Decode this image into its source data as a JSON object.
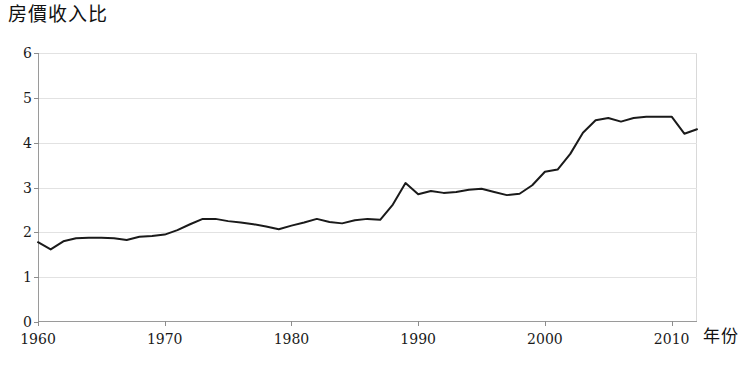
{
  "chart_data": {
    "type": "line",
    "title": "房價收入比",
    "xlabel": "年份",
    "ylabel": "",
    "xlim": [
      1960,
      2012
    ],
    "ylim": [
      0,
      6
    ],
    "grid": true,
    "legend": "none",
    "y_ticks": [
      0,
      1,
      2,
      3,
      4,
      5,
      6
    ],
    "x_ticks": [
      1960,
      1970,
      1980,
      1990,
      2000,
      2010
    ],
    "x": [
      1960,
      1961,
      1962,
      1963,
      1964,
      1965,
      1966,
      1967,
      1968,
      1969,
      1970,
      1971,
      1972,
      1973,
      1974,
      1975,
      1976,
      1977,
      1978,
      1979,
      1980,
      1981,
      1982,
      1983,
      1984,
      1985,
      1986,
      1987,
      1988,
      1989,
      1990,
      1991,
      1992,
      1993,
      1994,
      1995,
      1996,
      1997,
      1998,
      1999,
      2000,
      2001,
      2002,
      2003,
      2004,
      2005,
      2006,
      2007,
      2008,
      2009,
      2010,
      2011,
      2012
    ],
    "series": [
      {
        "name": "房價收入比",
        "color": "#1a1a1a",
        "values": [
          1.78,
          1.62,
          1.8,
          1.87,
          1.88,
          1.88,
          1.87,
          1.83,
          1.9,
          1.92,
          1.95,
          2.05,
          2.18,
          2.3,
          2.3,
          2.25,
          2.22,
          2.18,
          2.13,
          2.07,
          2.15,
          2.22,
          2.3,
          2.23,
          2.2,
          2.27,
          2.3,
          2.28,
          2.62,
          3.1,
          2.85,
          2.92,
          2.88,
          2.9,
          2.95,
          2.97,
          2.9,
          2.83,
          2.86,
          3.05,
          3.35,
          3.4,
          3.75,
          4.22,
          4.5,
          4.55,
          4.47,
          4.55,
          4.58,
          4.58,
          4.58,
          4.2,
          4.3
        ]
      }
    ]
  }
}
